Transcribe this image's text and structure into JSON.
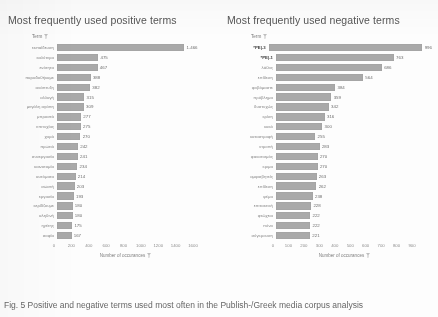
{
  "caption": "Fig. 5  Positive and negative terms used most often in the Publish-/Greek media corpus analysis",
  "axis_icon": "filter-icon",
  "header_icon": "filter-icon",
  "colors": {
    "bar": "#a9a9a9",
    "text": "#6d6d6d",
    "title": "#555555"
  },
  "chart_data": [
    {
      "type": "bar",
      "orientation": "horizontal",
      "title": "Most frequently used positive terms",
      "column_header": "Term",
      "xlabel": "Number of occurances",
      "ylabel": "",
      "xlim": [
        0,
        1600
      ],
      "xticks": [
        0,
        200,
        400,
        600,
        800,
        1000,
        1200,
        1400,
        1600
      ],
      "grid": false,
      "legend": "none",
      "categories": [
        "εκπαίδευση",
        "καλύτερα",
        "ενότητα",
        "παραδοθήκαμε",
        "ανάπτυξη",
        "αλλαγή",
        "μεγάλη αγάπη",
        "μπροστά",
        "επιτυχίας",
        "χαρά",
        "πρωτιά",
        "συνεργασία",
        "καινοτομία",
        "αυτόματα",
        "σωστή",
        "εργασία",
        "κερδίζουμε",
        "αληθινή",
        "ηγέτης",
        "σοφία"
      ],
      "values": [
        1466,
        475,
        467,
        388,
        382,
        315,
        309,
        277,
        275,
        270,
        242,
        241,
        234,
        214,
        203,
        193,
        180,
        180,
        175,
        167
      ],
      "value_labels": [
        "1.466",
        "475",
        "467",
        "388",
        "382",
        "315",
        "309",
        "277",
        "275",
        "270",
        "242",
        "241",
        "234",
        "214",
        "203",
        "193",
        "180",
        "180",
        "175",
        "167"
      ]
    },
    {
      "type": "bar",
      "orientation": "horizontal",
      "title": "Most frequently used negative terms",
      "column_header": "Term",
      "xlabel": "Number of occurances",
      "ylabel": "",
      "xlim": [
        0,
        900
      ],
      "xticks": [
        0,
        100,
        200,
        300,
        400,
        500,
        600,
        700,
        800,
        900
      ],
      "grid": false,
      "legend": "none",
      "categories": [
        "*ΡΕ|-3",
        "*ΡΕ|-1",
        "λάθος",
        "επίθεση",
        "φοβόμαστε",
        "πρόβλημα",
        "δυστυχώς",
        "κρίση",
        "κακό",
        "καταστροφή",
        "ντροπή",
        "φανατισμός",
        "κριμα",
        "αμφισβητείς",
        "επίθεση",
        "ψέμα",
        "επιτακτική",
        "φτώχεια",
        "πόνο",
        "σύγκρουση"
      ],
      "values": [
        996,
        763,
        686,
        564,
        384,
        359,
        342,
        316,
        300,
        255,
        283,
        270,
        270,
        263,
        262,
        238,
        228,
        222,
        222,
        221
      ],
      "value_labels": [
        "996",
        "763",
        "686",
        "564",
        "384",
        "359",
        "342",
        "316",
        "300",
        "255",
        "283",
        "270",
        "270",
        "263",
        "262",
        "238",
        "228",
        "222",
        "222",
        "221"
      ],
      "highlight_rows": [
        0,
        1
      ]
    }
  ]
}
